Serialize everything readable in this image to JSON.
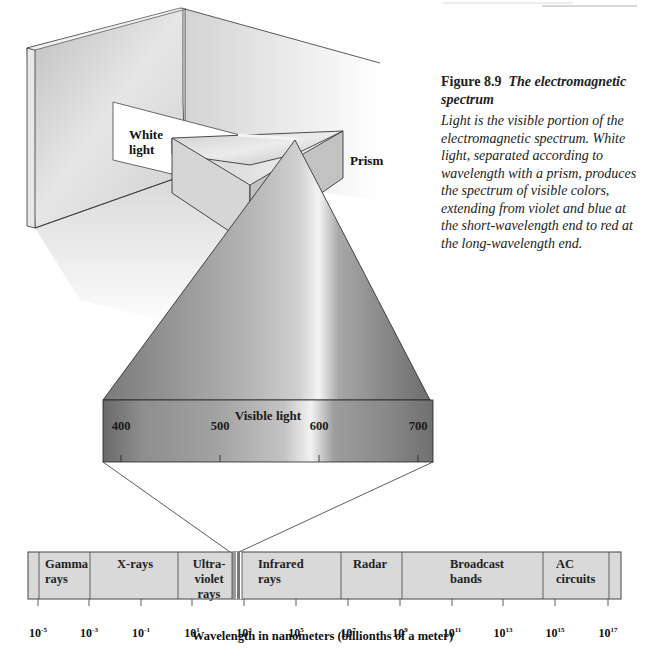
{
  "figure": {
    "number": "Figure 8.9",
    "title": "The electromagnetic spectrum",
    "caption": "Light is the visible portion of the electromagnetic spectrum. White light, separated according to wavelength with a prism, produces the spectrum of visible colors, extending from violet and blue at the short-wavelength end to red at the long-wavelength end."
  },
  "illustration": {
    "white_light_label": [
      "White",
      "light"
    ],
    "prism_label": "Prism"
  },
  "visible_band": {
    "title": "Visible light",
    "ticks": [
      "400",
      "500",
      "600",
      "700"
    ]
  },
  "spectrum_bar": {
    "bands": [
      {
        "label": [
          "Gamma",
          "rays"
        ]
      },
      {
        "label": [
          "X-rays"
        ]
      },
      {
        "label": [
          "Ultra-",
          "violet",
          "rays"
        ]
      },
      {
        "label": [
          "Infrared",
          "rays"
        ]
      },
      {
        "label": [
          "Radar"
        ]
      },
      {
        "label": [
          "Broadcast",
          "bands"
        ]
      },
      {
        "label": [
          "AC",
          "circuits"
        ]
      }
    ],
    "axis_ticks": [
      {
        "base": "10",
        "exp": "-5"
      },
      {
        "base": "10",
        "exp": "-3"
      },
      {
        "base": "10",
        "exp": "-1"
      },
      {
        "base": "10",
        "exp": "1"
      },
      {
        "base": "10",
        "exp": "3"
      },
      {
        "base": "10",
        "exp": "5"
      },
      {
        "base": "10",
        "exp": "7"
      },
      {
        "base": "10",
        "exp": "9"
      },
      {
        "base": "10",
        "exp": "11"
      },
      {
        "base": "10",
        "exp": "13"
      },
      {
        "base": "10",
        "exp": "15"
      },
      {
        "base": "10",
        "exp": "17"
      }
    ],
    "axis_title": "Wavelength in nanometers (billionths of a meter)"
  },
  "colors": {
    "bar_fill": "#d9d9d9",
    "bar_border": "#555555",
    "cone_dark": "#6e6e6e",
    "cone_light": "#c9c9c9",
    "wall": "#d4d4d4"
  }
}
